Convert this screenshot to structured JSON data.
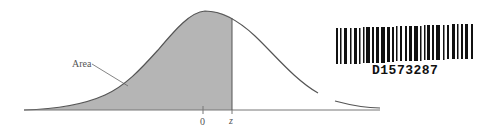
{
  "figure": {
    "area_label": "Area",
    "tick_zero": "0",
    "tick_z": "z",
    "fill_color": "#b5b5b5",
    "curve_color": "#555555"
  },
  "barcode": {
    "text": "D1573287"
  }
}
